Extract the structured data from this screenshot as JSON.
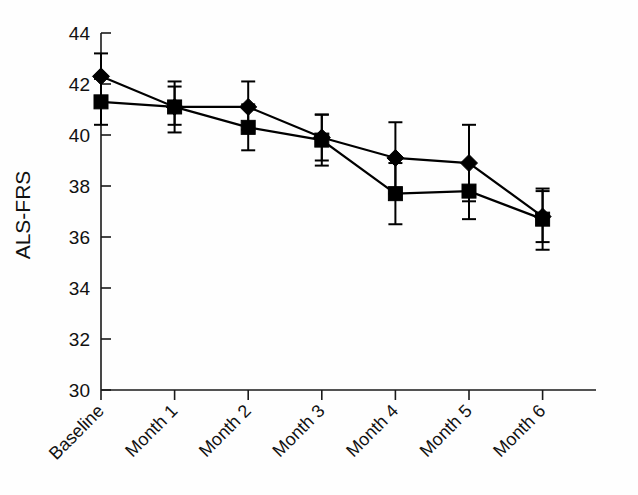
{
  "chart_data": {
    "type": "line",
    "title": "",
    "xlabel": "",
    "ylabel": "ALS-FRS",
    "categories": [
      "Baseline",
      "Month 1",
      "Month 2",
      "Month 3",
      "Month 4",
      "Month 5",
      "Month 6"
    ],
    "ylim": [
      30,
      44
    ],
    "yticks": [
      30,
      32,
      34,
      36,
      38,
      40,
      42,
      44
    ],
    "ytick_labels": [
      "30",
      "32",
      "34",
      "36",
      "38",
      "40",
      "42",
      "44"
    ],
    "grid": false,
    "legend": "none",
    "error_bars": "vertical, capped (SEM/95% CI)",
    "series": [
      {
        "name": "diamond-series",
        "marker": "diamond",
        "values": [
          42.3,
          41.1,
          41.1,
          39.9,
          39.1,
          38.9,
          36.8
        ],
        "err_low": [
          41.5,
          40.4,
          40.2,
          39.0,
          37.7,
          37.4,
          35.8
        ],
        "err_high": [
          43.2,
          41.9,
          42.1,
          40.8,
          40.5,
          40.4,
          37.8
        ]
      },
      {
        "name": "square-series",
        "marker": "square",
        "values": [
          41.3,
          41.1,
          40.3,
          39.8,
          37.7,
          37.8,
          36.7
        ],
        "err_low": [
          40.4,
          40.1,
          39.4,
          38.8,
          36.5,
          36.7,
          35.5
        ],
        "err_high": [
          42.2,
          42.1,
          41.2,
          40.8,
          38.9,
          38.9,
          37.9
        ]
      }
    ]
  },
  "axis": {
    "y_label": "ALS-FRS",
    "y_min_label": "30",
    "y_max_label": "44"
  }
}
